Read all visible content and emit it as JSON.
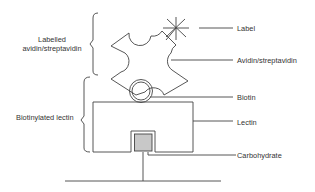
{
  "diagram": {
    "type": "biotin-avidin lectin detection schematic",
    "colors": {
      "line": "#444444",
      "carbohydrate_fill": "#c8c8c8",
      "background": "#ffffff"
    },
    "right_labels": {
      "label": "Label",
      "avidin": "Avidin/streptavidin",
      "biotin": "Biotin",
      "lectin": "Lectin",
      "carbohydrate": "Carbohydrate"
    },
    "left_labels": {
      "labelled_avidin_line1": "Labelled",
      "labelled_avidin_line2": "avidin/streptavidin",
      "biotinylated_lectin": "Biotinylated lectin"
    }
  }
}
